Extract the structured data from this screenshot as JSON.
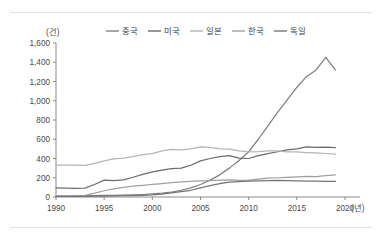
{
  "chart_data": {
    "type": "line",
    "title": "",
    "xlabel": "(년)",
    "ylabel": "(건)",
    "y_unit": "(건)",
    "x_unit": "(년)",
    "grid": false,
    "legend_position": "top",
    "xlim": [
      1990,
      2020
    ],
    "ylim": [
      0,
      1600
    ],
    "y_ticks": [
      0,
      200,
      400,
      600,
      800,
      1000,
      1200,
      1400,
      1600
    ],
    "y_tick_labels": [
      "0",
      "200",
      "400",
      "600",
      "800",
      "1,000",
      "1,200",
      "1,400",
      "1,600"
    ],
    "x_ticks": [
      1990,
      1995,
      2000,
      2005,
      2010,
      2015,
      2020
    ],
    "x_tick_labels": [
      "1990",
      "1995",
      "2000",
      "2005",
      "2010",
      "2015",
      "2020"
    ],
    "x": [
      1990,
      1991,
      1992,
      1993,
      1994,
      1995,
      1996,
      1997,
      1998,
      1999,
      2000,
      2001,
      2002,
      2003,
      2004,
      2005,
      2006,
      2007,
      2008,
      2009,
      2010,
      2011,
      2012,
      2013,
      2014,
      2015,
      2016,
      2017,
      2018,
      2019
    ],
    "series": [
      {
        "name": "중국",
        "color": "#7f7f7f",
        "values": [
          8,
          9,
          10,
          12,
          14,
          16,
          18,
          20,
          22,
          26,
          32,
          40,
          52,
          70,
          95,
          130,
          175,
          230,
          300,
          380,
          470,
          600,
          740,
          880,
          1010,
          1140,
          1250,
          1320,
          1450,
          1320
        ]
      },
      {
        "name": "미국",
        "color": "#6b6b6b",
        "values": [
          95,
          92,
          90,
          92,
          130,
          175,
          170,
          178,
          205,
          235,
          260,
          280,
          295,
          300,
          330,
          375,
          400,
          420,
          430,
          405,
          400,
          430,
          450,
          470,
          490,
          500,
          520,
          515,
          518,
          512
        ]
      },
      {
        "name": "일본",
        "color": "#b4b4b4",
        "values": [
          330,
          330,
          330,
          328,
          350,
          375,
          395,
          405,
          420,
          440,
          450,
          480,
          495,
          490,
          500,
          520,
          515,
          500,
          498,
          480,
          470,
          472,
          480,
          478,
          470,
          468,
          462,
          458,
          452,
          445
        ]
      },
      {
        "name": "한국",
        "color": "#a0a0a0",
        "values": [
          6,
          8,
          12,
          18,
          40,
          65,
          85,
          100,
          112,
          120,
          130,
          140,
          150,
          158,
          162,
          168,
          170,
          175,
          178,
          172,
          175,
          185,
          195,
          200,
          205,
          210,
          214,
          212,
          222,
          230
        ]
      },
      {
        "name": "독일",
        "color": "#757575",
        "values": [
          6,
          6,
          7,
          7,
          8,
          10,
          12,
          14,
          15,
          18,
          22,
          30,
          42,
          55,
          70,
          95,
          118,
          140,
          155,
          160,
          165,
          168,
          170,
          172,
          170,
          168,
          166,
          165,
          163,
          162
        ]
      }
    ]
  },
  "legend": {
    "items": [
      {
        "label": "중국"
      },
      {
        "label": "미국"
      },
      {
        "label": "일본"
      },
      {
        "label": "한국"
      },
      {
        "label": "독일"
      }
    ]
  },
  "axes": {
    "y_unit_label": "(건)",
    "x_unit_label": "(년)"
  }
}
